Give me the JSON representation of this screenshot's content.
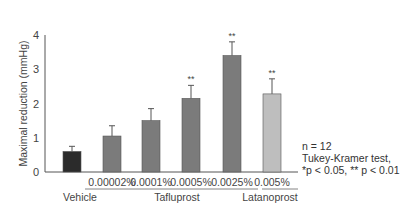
{
  "chart_data": {
    "type": "bar",
    "title": "",
    "xlabel": "",
    "ylabel": "Maximal reduction (mmHg)",
    "ylim": [
      0,
      4
    ],
    "yticks": [
      0,
      1,
      2,
      3,
      4
    ],
    "grid": false,
    "categories": [
      "Vehicle",
      "0.00002%",
      "0.0001%",
      "0.0005%",
      "0.0025%",
      "0.005%"
    ],
    "groups": [
      {
        "label": "Vehicle",
        "members": [
          "Vehicle"
        ]
      },
      {
        "label": "Tafluprost",
        "members": [
          "0.00002%",
          "0.0001%",
          "0.0005%",
          "0.0025%"
        ]
      },
      {
        "label": "Latanoprost",
        "members": [
          "0.005%"
        ]
      }
    ],
    "values": [
      0.6,
      1.05,
      1.5,
      2.15,
      3.4,
      2.28
    ],
    "errors": [
      0.15,
      0.3,
      0.35,
      0.38,
      0.4,
      0.44
    ],
    "significance": [
      "",
      "",
      "",
      "**",
      "**",
      "**"
    ],
    "bar_colors": [
      "#2b2b2b",
      "#7b7b7b",
      "#7b7b7b",
      "#7b7b7b",
      "#7b7b7b",
      "#bebebe"
    ],
    "annotations": [
      "n = 12",
      "Tukey-Kramer test,",
      "*p < 0.05, ** p < 0.01"
    ]
  },
  "notes": {
    "line1": "n = 12",
    "line2": "Tukey-Kramer test,",
    "line3": "*p < 0.05, ** p < 0.01"
  }
}
